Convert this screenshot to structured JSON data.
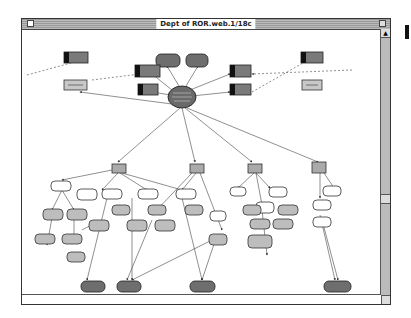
{
  "window": {
    "title": "Dept of ROR.web.1/18c",
    "controls": {
      "close": "close-box",
      "zoom": "zoom-box",
      "grow": "grow-box"
    },
    "scrollbar": {
      "up_arrow": "▲",
      "down_arrow": "▼"
    }
  },
  "diagram": {
    "type": "concept-map",
    "center_node": {
      "label": "Dept of ROR · web · overview",
      "shape": "ellipse",
      "fill": "#666666"
    },
    "colors": {
      "dark_node": "#6e6e6e",
      "light_node": "#c8c8c8",
      "white_node": "#ffffff",
      "black_tab": "#111111",
      "edge": "#333333"
    }
  }
}
